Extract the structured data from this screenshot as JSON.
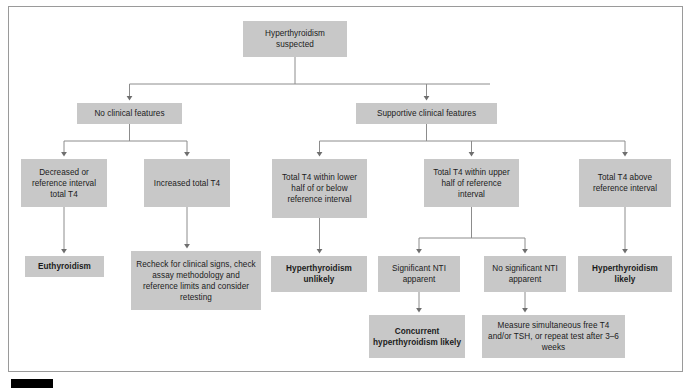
{
  "figure": {
    "type": "clinical-decision-flowchart",
    "colors": {
      "node_fill": "#c8c8c8",
      "node_text": "#1b1b1b",
      "connector": "#8c8c8c",
      "frame_border": "#9a9a9a",
      "caption_bar": "#000000"
    },
    "nodes": [
      {
        "id": "n1",
        "label": "Hyperthyroidism suspected",
        "lines": [
          "Hyperthyroidism",
          "suspected"
        ],
        "bold": false,
        "x": 243,
        "y": 21,
        "w": 104,
        "h": 36
      },
      {
        "id": "n2",
        "label": "No clinical features",
        "lines": [
          "No clinical features"
        ],
        "bold": false,
        "x": 77,
        "y": 103,
        "w": 105,
        "h": 21
      },
      {
        "id": "n3",
        "label": "Supportive clinical features",
        "lines": [
          "Supportive clinical features"
        ],
        "bold": false,
        "x": 356,
        "y": 103,
        "w": 141,
        "h": 21
      },
      {
        "id": "n4",
        "label": "Decreased or reference interval total T4",
        "lines": [
          "Decreased or",
          "reference",
          "interval total T4"
        ],
        "bold": false,
        "x": 21,
        "y": 159,
        "w": 86,
        "h": 48
      },
      {
        "id": "n5",
        "label": "Increased total T4",
        "lines": [
          "Increased",
          "total T4"
        ],
        "bold": false,
        "x": 144,
        "y": 159,
        "w": 86,
        "h": 48
      },
      {
        "id": "n6",
        "label": "Total T4 within lower half of or below reference interval",
        "lines": [
          "Total T4 within",
          "lower half of or",
          "below reference",
          "interval"
        ],
        "bold": false,
        "x": 272,
        "y": 159,
        "w": 95,
        "h": 59
      },
      {
        "id": "n7",
        "label": "Total T4 within upper half of reference interval",
        "lines": [
          "Total T4 within",
          "upper half of",
          "reference interval"
        ],
        "bold": false,
        "x": 424,
        "y": 159,
        "w": 95,
        "h": 48
      },
      {
        "id": "n8",
        "label": "Total T4 above reference interval",
        "lines": [
          "Total T4 above",
          "reference interval"
        ],
        "bold": false,
        "x": 579,
        "y": 159,
        "w": 92,
        "h": 48
      },
      {
        "id": "n9",
        "label": "Euthyroidism",
        "lines": [
          "Euthyroidism"
        ],
        "bold": true,
        "x": 25,
        "y": 256,
        "w": 79,
        "h": 21
      },
      {
        "id": "n10",
        "label": "Recheck for clinical signs, check assay methodology and reference limits and consider retesting",
        "lines": [
          "Recheck for clinical signs,",
          "check assay methodology",
          "and reference limits and",
          "consider retesting"
        ],
        "bold": false,
        "x": 131,
        "y": 251,
        "w": 130,
        "h": 59
      },
      {
        "id": "n11",
        "label": "Hyperthyroidism unlikely",
        "lines": [
          "Hyperthyroidism",
          "unlikely"
        ],
        "bold": true,
        "x": 271,
        "y": 256,
        "w": 96,
        "h": 36
      },
      {
        "id": "n12",
        "label": "Significant NTI apparent",
        "lines": [
          "Significant",
          "NTI apparent"
        ],
        "bold": false,
        "x": 378,
        "y": 256,
        "w": 82,
        "h": 36
      },
      {
        "id": "n13",
        "label": "No significant NTI apparent",
        "lines": [
          "No significant",
          "NTI apparent"
        ],
        "bold": false,
        "x": 484,
        "y": 256,
        "w": 82,
        "h": 36
      },
      {
        "id": "n14",
        "label": "Hyperthyroidism likely",
        "lines": [
          "Hyperthyroidism",
          "likely"
        ],
        "bold": true,
        "x": 578,
        "y": 256,
        "w": 94,
        "h": 36
      },
      {
        "id": "n15",
        "label": "Concurrent hyperthyroidism likely",
        "lines": [
          "Concurrent",
          "hyperthyroidism",
          "likely"
        ],
        "bold": true,
        "x": 369,
        "y": 315,
        "w": 96,
        "h": 43
      },
      {
        "id": "n16",
        "label": "Measure simultaneous free T4 and/or TSH, or repeat test after 3–6 weeks",
        "lines": [
          "Measure simultaneous free",
          "T4 and/or TSH, or repeat test",
          "after 3–6 weeks"
        ],
        "bold": false,
        "x": 482,
        "y": 315,
        "w": 143,
        "h": 43
      }
    ],
    "edges": [
      {
        "from": "n1",
        "to": "n2"
      },
      {
        "from": "n1",
        "to": "n3"
      },
      {
        "from": "n2",
        "to": "n4"
      },
      {
        "from": "n2",
        "to": "n5"
      },
      {
        "from": "n3",
        "to": "n6"
      },
      {
        "from": "n3",
        "to": "n7"
      },
      {
        "from": "n3",
        "to": "n8"
      },
      {
        "from": "n4",
        "to": "n9"
      },
      {
        "from": "n5",
        "to": "n10"
      },
      {
        "from": "n6",
        "to": "n11"
      },
      {
        "from": "n7",
        "to": "n12"
      },
      {
        "from": "n7",
        "to": "n13"
      },
      {
        "from": "n8",
        "to": "n14"
      },
      {
        "from": "n12",
        "to": "n15"
      },
      {
        "from": "n13",
        "to": "n16"
      }
    ]
  }
}
